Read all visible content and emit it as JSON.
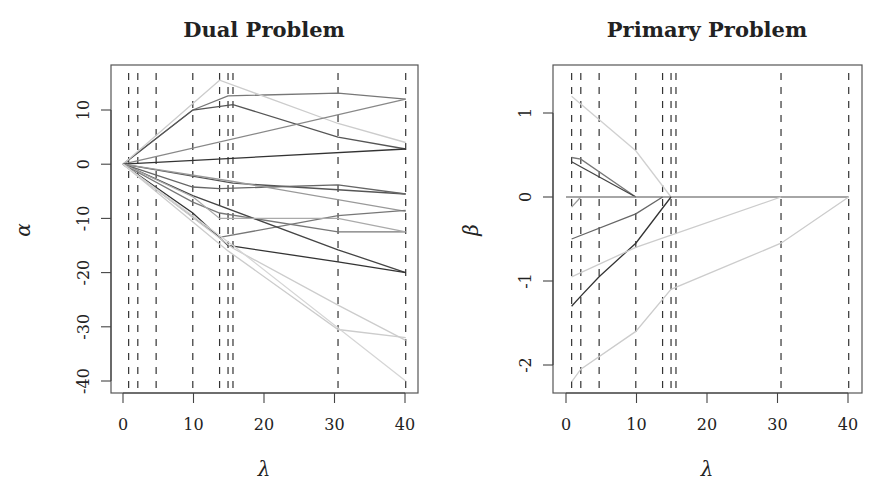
{
  "figure": {
    "panel_marker": "(a)"
  },
  "chart_data": [
    {
      "type": "line",
      "title": "Dual Problem",
      "xlabel": "λ",
      "ylabel": "α",
      "xlim": [
        -1.8,
        41.5
      ],
      "ylim": [
        -42.5,
        17.5
      ],
      "xticks": [
        0,
        10,
        20,
        30,
        40
      ],
      "xtick_labels": [
        "0",
        "10",
        "20",
        "30",
        "40"
      ],
      "yticks": [
        10,
        0,
        -10,
        -20,
        -30,
        -40
      ],
      "ytick_labels": [
        "10",
        "0",
        "-10",
        "-20",
        "-30",
        "-40"
      ],
      "grid": false,
      "legend": null,
      "breakpoints": [
        0.8,
        2.1,
        4.7,
        9.9,
        13.7,
        14.9,
        15.6,
        30.5,
        40.1
      ],
      "series": [
        {
          "name": "path-1",
          "color": "#777777",
          "x": [
            0,
            9.9,
            14.9,
            30.5,
            40.1
          ],
          "y": [
            0,
            10,
            12.6,
            13.1,
            12.0
          ]
        },
        {
          "name": "path-2",
          "color": "#555555",
          "x": [
            0,
            9.9,
            15.6,
            30.5,
            40.1
          ],
          "y": [
            0,
            10,
            11.0,
            5.0,
            2.8
          ]
        },
        {
          "name": "path-3",
          "color": "#cccccc",
          "x": [
            0,
            13.7,
            30.5,
            40.1
          ],
          "y": [
            0,
            15.5,
            7.5,
            4.0
          ]
        },
        {
          "name": "path-4",
          "color": "#888888",
          "x": [
            0,
            40.1
          ],
          "y": [
            0,
            12.0
          ]
        },
        {
          "name": "path-5",
          "color": "#333333",
          "x": [
            0,
            40.1
          ],
          "y": [
            0,
            2.8
          ]
        },
        {
          "name": "path-6",
          "color": "#555555",
          "x": [
            0,
            15.6,
            40.1
          ],
          "y": [
            0,
            -3.5,
            -5.5
          ]
        },
        {
          "name": "path-7",
          "color": "#666666",
          "x": [
            0,
            9.9,
            13.7,
            30.5,
            40.1
          ],
          "y": [
            0,
            -4.2,
            -4.5,
            -3.8,
            -5.5
          ]
        },
        {
          "name": "path-8",
          "color": "#999999",
          "x": [
            0,
            15.6,
            40.1
          ],
          "y": [
            0,
            -3.2,
            -8.7
          ]
        },
        {
          "name": "path-9",
          "color": "#777777",
          "x": [
            0,
            9.9,
            13.7,
            30.5,
            40.1
          ],
          "y": [
            0,
            -7.0,
            -9.0,
            -12.5,
            -12.5
          ]
        },
        {
          "name": "path-10",
          "color": "#777777",
          "x": [
            0,
            13.7,
            30.5,
            40.1
          ],
          "y": [
            0,
            -13.5,
            -9.5,
            -8.5
          ]
        },
        {
          "name": "path-11",
          "color": "#444444",
          "x": [
            0,
            9.9,
            30.5,
            40.1
          ],
          "y": [
            0,
            -5.8,
            -15.8,
            -20.0
          ]
        },
        {
          "name": "path-12",
          "color": "#333333",
          "x": [
            0,
            9.9,
            14.9,
            30.5,
            40.1
          ],
          "y": [
            0,
            -9.0,
            -15.0,
            -18.0,
            -20.0
          ]
        },
        {
          "name": "path-13",
          "color": "#aaaaaa",
          "x": [
            0,
            9.9,
            13.7,
            30.5,
            40.1
          ],
          "y": [
            0,
            -6.0,
            -10.0,
            -10.0,
            -12.5
          ]
        },
        {
          "name": "path-14",
          "color": "#cccccc",
          "x": [
            0,
            15.6,
            30.5,
            40.1
          ],
          "y": [
            0,
            -15.5,
            -26.0,
            -32.5
          ]
        },
        {
          "name": "path-15",
          "color": "#cccccc",
          "x": [
            0,
            14.9,
            30.5,
            40.1
          ],
          "y": [
            0,
            -16.0,
            -30.5,
            -32.0
          ]
        },
        {
          "name": "path-16",
          "color": "#d5d5d5",
          "x": [
            0,
            15.6,
            40.1
          ],
          "y": [
            0,
            -15.0,
            -40.0
          ]
        }
      ]
    },
    {
      "type": "line",
      "title": "Primary Problem",
      "xlabel": "λ",
      "ylabel": "β",
      "xlim": [
        -1.8,
        41.9
      ],
      "ylim": [
        -2.35,
        1.6
      ],
      "xticks": [
        0,
        10,
        20,
        30,
        40
      ],
      "xtick_labels": [
        "0",
        "10",
        "20",
        "30",
        "40"
      ],
      "yticks": [
        1,
        0,
        -1,
        -2
      ],
      "ytick_labels": [
        "1",
        "0",
        "-1",
        "-2"
      ],
      "grid": false,
      "legend": null,
      "breakpoints": [
        0.8,
        2.1,
        4.7,
        9.9,
        13.7,
        14.9,
        15.6,
        30.5,
        40.1
      ],
      "series": [
        {
          "name": "beta-1",
          "color": "#d0d0d0",
          "x": [
            0.8,
            9.9,
            14.9
          ],
          "y": [
            1.2,
            0.55,
            0.0
          ]
        },
        {
          "name": "beta-2",
          "color": "#777777",
          "x": [
            0.8,
            2.1,
            9.9
          ],
          "y": [
            0.47,
            0.45,
            0.0
          ]
        },
        {
          "name": "beta-3",
          "color": "#444444",
          "x": [
            0.8,
            9.9
          ],
          "y": [
            0.42,
            0.0
          ]
        },
        {
          "name": "beta-4",
          "color": "#888888",
          "x": [
            0.0,
            40.1
          ],
          "y": [
            0.0,
            0.0
          ]
        },
        {
          "name": "beta-5",
          "color": "#999999",
          "x": [
            0.8,
            2.1
          ],
          "y": [
            -0.12,
            0.0
          ]
        },
        {
          "name": "beta-6",
          "color": "#666666",
          "x": [
            0.8,
            9.9,
            13.7
          ],
          "y": [
            -0.5,
            -0.2,
            0.0
          ]
        },
        {
          "name": "beta-7",
          "color": "#333333",
          "x": [
            0.8,
            2.1,
            4.7,
            9.9,
            14.9
          ],
          "y": [
            -1.3,
            -1.18,
            -0.95,
            -0.55,
            0.0
          ]
        },
        {
          "name": "beta-8",
          "color": "#cccccc",
          "x": [
            0.8,
            9.9,
            30.5
          ],
          "y": [
            -0.95,
            -0.6,
            0.0
          ]
        },
        {
          "name": "beta-9",
          "color": "#cccccc",
          "x": [
            0.8,
            2.1,
            9.9,
            14.9,
            30.5,
            40.1
          ],
          "y": [
            -2.2,
            -2.05,
            -1.6,
            -1.1,
            -0.55,
            0.0
          ]
        }
      ]
    }
  ]
}
